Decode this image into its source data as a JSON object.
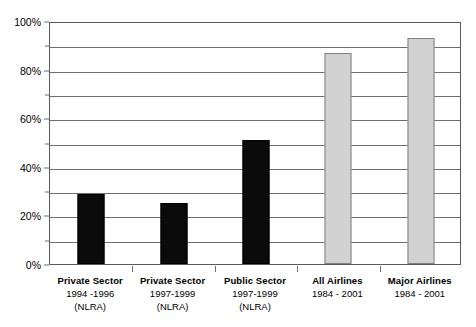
{
  "chart_data": {
    "type": "bar",
    "title": "",
    "subtitle": "",
    "xlabel": "",
    "ylabel": "",
    "ylim": [
      0,
      100
    ],
    "y_unit": "%",
    "grid": true,
    "grid_minor_step": 10,
    "legend": "none",
    "categories": [
      "Private Sector 1994 -1996 (NLRA)",
      "Private Sector 1997-1999 (NLRA)",
      "Public Sector 1997-1999 (NLRA)",
      "All Airlines 1984 - 2001",
      "Major Airlines 1984 - 2001"
    ],
    "values": [
      29,
      25,
      51,
      87,
      93
    ],
    "bar_colors": [
      "#0b0b0b",
      "#0b0b0b",
      "#0b0b0b",
      "#d2d2d2",
      "#d2d2d2"
    ]
  },
  "axes": {
    "y_ticks": [
      {
        "value": 0,
        "label": "0%"
      },
      {
        "value": 10,
        "label": ""
      },
      {
        "value": 20,
        "label": "20%"
      },
      {
        "value": 30,
        "label": ""
      },
      {
        "value": 40,
        "label": "40%"
      },
      {
        "value": 50,
        "label": ""
      },
      {
        "value": 60,
        "label": "60%"
      },
      {
        "value": 70,
        "label": ""
      },
      {
        "value": 80,
        "label": "80%"
      },
      {
        "value": 90,
        "label": ""
      },
      {
        "value": 100,
        "label": "100%"
      }
    ]
  },
  "x_axis_labels": [
    {
      "line1": "Private Sector",
      "line2": "1994 -1996",
      "line3": "(NLRA)"
    },
    {
      "line1": "Private Sector",
      "line2": "1997-1999",
      "line3": "(NLRA)"
    },
    {
      "line1": "Public Sector",
      "line2": "1997-1999",
      "line3": "(NLRA)"
    },
    {
      "line1": "All Airlines",
      "line2": "1984 - 2001",
      "line3": ""
    },
    {
      "line1": "Major Airlines",
      "line2": "1984 - 2001",
      "line3": ""
    }
  ],
  "colors": {
    "dark_bar": "#0b0b0b",
    "light_bar": "#d2d2d2",
    "light_bar_border": "#808080",
    "axis": "#5a5a5a",
    "gridline": "#6e6e6e",
    "background": "#ffffff",
    "text": "#000000"
  }
}
